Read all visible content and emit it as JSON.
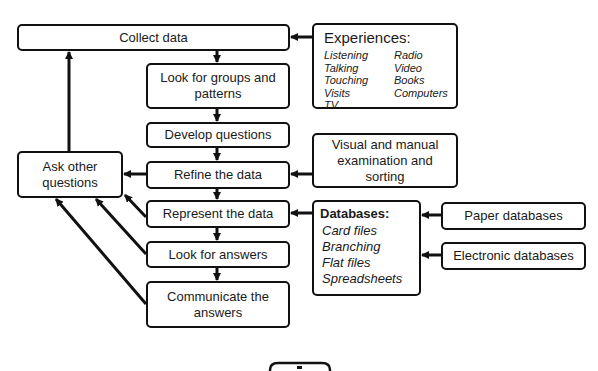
{
  "diagram": {
    "main_flow": [
      {
        "id": "collect",
        "label": "Collect data"
      },
      {
        "id": "groups",
        "label": "Look for groups and patterns"
      },
      {
        "id": "develop",
        "label": "Develop questions"
      },
      {
        "id": "refine",
        "label": "Refine the data"
      },
      {
        "id": "represent",
        "label": "Represent the data"
      },
      {
        "id": "answers",
        "label": "Look for answers"
      },
      {
        "id": "communicate",
        "label": "Communicate the answers"
      }
    ],
    "ask": {
      "label_line1": "Ask other",
      "label_line2": "questions"
    },
    "groups_line1": "Look for groups and",
    "groups_line2": "patterns",
    "communicate_line1": "Communicate the",
    "communicate_line2": "answers",
    "experiences": {
      "title": "Experiences:",
      "items": [
        "Listening",
        "Radio",
        "Talking",
        "Video",
        "Touching",
        "Books",
        "Visits",
        "Computers",
        "TV"
      ]
    },
    "visual": {
      "line1": "Visual and manual",
      "line2": "examination and",
      "line3": "sorting"
    },
    "databases": {
      "title": "Databases:",
      "items": [
        "Card files",
        "Branching",
        "Flat files",
        "Spreadsheets"
      ]
    },
    "paper": {
      "label": "Paper databases"
    },
    "electronic": {
      "label": "Electronic databases"
    },
    "edges": [
      {
        "from": "Experiences",
        "to": "Collect data"
      },
      {
        "from": "Collect data",
        "to": "Look for groups and patterns"
      },
      {
        "from": "Look for groups and patterns",
        "to": "Develop questions"
      },
      {
        "from": "Develop questions",
        "to": "Refine the data"
      },
      {
        "from": "Refine the data",
        "to": "Represent the data"
      },
      {
        "from": "Represent the data",
        "to": "Look for answers"
      },
      {
        "from": "Look for answers",
        "to": "Communicate the answers"
      },
      {
        "from": "Visual and manual examination and sorting",
        "to": "Refine the data"
      },
      {
        "from": "Databases",
        "to": "Represent the data"
      },
      {
        "from": "Paper databases",
        "to": "Databases"
      },
      {
        "from": "Electronic databases",
        "to": "Databases"
      },
      {
        "from": "Refine the data",
        "to": "Ask other questions"
      },
      {
        "from": "Represent the data",
        "to": "Ask other questions"
      },
      {
        "from": "Look for answers",
        "to": "Ask other questions"
      },
      {
        "from": "Communicate the answers",
        "to": "Ask other questions"
      },
      {
        "from": "Ask other questions",
        "to": "Collect data"
      }
    ]
  }
}
